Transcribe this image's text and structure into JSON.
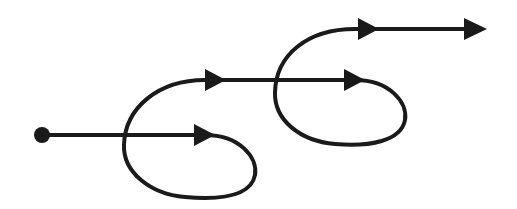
{
  "diagram": {
    "type": "trajectory-with-loops",
    "colors": {
      "stroke": "#1a1a1a",
      "background": "#ffffff"
    },
    "start_point": {
      "x": 42,
      "y": 135
    },
    "segments": [
      {
        "id": "line-1",
        "y": 135,
        "x_start": 42,
        "x_end": 212,
        "arrow_at": 212
      },
      {
        "id": "loop-1",
        "direction": "clockwise",
        "rightmost_x": 256,
        "bottom_y": 197,
        "leftmost_x": 124
      },
      {
        "id": "line-2",
        "y": 80,
        "x_start": 195,
        "x_end": 362,
        "arrow_at": [
          218,
          362
        ]
      },
      {
        "id": "loop-2",
        "direction": "clockwise",
        "rightmost_x": 406,
        "bottom_y": 145,
        "leftmost_x": 275
      },
      {
        "id": "line-3",
        "y": 30,
        "x_start": 345,
        "x_end": 485,
        "arrow_at": [
          373,
          485
        ]
      }
    ],
    "arrow_count": 5,
    "label": "Looping trajectory diagram"
  }
}
